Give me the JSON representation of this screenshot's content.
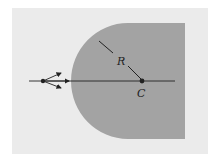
{
  "diagram": {
    "type": "spherical refracting surface",
    "labels": {
      "radius": "R",
      "center": "C"
    },
    "colors": {
      "background": "#ebebeb",
      "medium": "#a3a3a3",
      "lines": "#222222"
    }
  }
}
